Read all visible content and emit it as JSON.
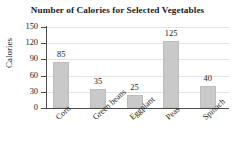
{
  "chart_data": {
    "type": "bar",
    "title": "Number of Calories for Selected Vegetables",
    "xlabel": "",
    "ylabel": "Calories",
    "categories": [
      "Corn",
      "Green beans",
      "Eggplant",
      "Peas",
      "Spinach"
    ],
    "values": [
      85,
      35,
      25,
      125,
      40
    ],
    "value_labels": [
      "85",
      "35",
      "25",
      "125",
      "40"
    ],
    "ylim": [
      0,
      150
    ],
    "yticks": [
      0,
      30,
      60,
      90,
      120,
      150
    ],
    "ytick_labels": [
      "0",
      "30",
      "60",
      "90",
      "120",
      "150"
    ],
    "grid": true,
    "grid_axis": "y",
    "legend": false,
    "bar_color": "#c9c9c9",
    "axis_color": "#4c4c4c",
    "grid_color": "#e4e4e4",
    "text_color": "#1a1a1a"
  }
}
